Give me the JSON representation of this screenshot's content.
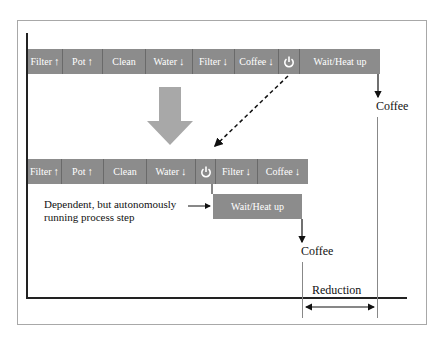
{
  "diagram": {
    "before": {
      "steps": [
        {
          "label": "Filter",
          "arrow": "↑"
        },
        {
          "label": "Pot",
          "arrow": "↑"
        },
        {
          "label": "Clean",
          "arrow": ""
        },
        {
          "label": "Water",
          "arrow": "↓"
        },
        {
          "label": "Filter",
          "arrow": "↓"
        },
        {
          "label": "Coffee",
          "arrow": "↓"
        },
        {
          "label": "",
          "icon": "power-icon"
        },
        {
          "label": "Wait/Heat up",
          "arrow": ""
        }
      ],
      "output_label": "Coffee"
    },
    "after": {
      "steps": [
        {
          "label": "Filter",
          "arrow": "↑"
        },
        {
          "label": "Pot",
          "arrow": "↑"
        },
        {
          "label": "Clean",
          "arrow": ""
        },
        {
          "label": "Water",
          "arrow": "↓"
        },
        {
          "label": "",
          "icon": "power-icon"
        },
        {
          "label": "Filter",
          "arrow": "↓"
        },
        {
          "label": "Coffee",
          "arrow": "↓"
        }
      ],
      "parallel_step": "Wait/Heat up",
      "output_label": "Coffee"
    },
    "annotation": "Dependent, but autonomously running process step",
    "annotation_line1": "Dependent, but autonomously",
    "annotation_line2": "running process step",
    "reduction_label": "Reduction",
    "colors": {
      "bar": "#8c8c8c",
      "big_arrow": "#a8a8a8",
      "line": "#111111"
    }
  }
}
